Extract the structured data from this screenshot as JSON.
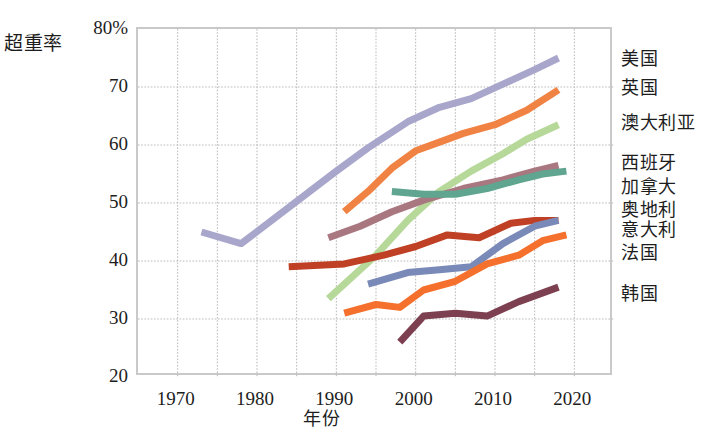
{
  "chart_data": {
    "type": "line",
    "title": "",
    "xlabel": "年份",
    "ylabel": "超重率",
    "xlim": [
      1965,
      2025
    ],
    "ylim": [
      20,
      80
    ],
    "grid": true,
    "legend_position": "right-inline",
    "x_ticks": [
      "1970",
      "1980",
      "1990",
      "2000",
      "2010",
      "2020"
    ],
    "x_tick_values": [
      1970,
      1980,
      1990,
      2000,
      2010,
      2020
    ],
    "y_ticks": [
      "20",
      "30",
      "40",
      "50",
      "60",
      "70",
      "80%"
    ],
    "y_tick_values": [
      20,
      30,
      40,
      50,
      60,
      70,
      80
    ],
    "series": [
      {
        "name": "美国",
        "color": "#a8a6cb",
        "label_y": 74.5,
        "x": [
          1973,
          1978,
          1990,
          1994,
          1999,
          2003,
          2007,
          2011,
          2015,
          2018
        ],
        "values": [
          45.0,
          43.0,
          55.5,
          59.5,
          64.0,
          66.5,
          68.0,
          70.5,
          73.0,
          75.0
        ]
      },
      {
        "name": "英国",
        "color": "#f08344",
        "label_y": 69.5,
        "x": [
          1991,
          1994,
          1997,
          2000,
          2003,
          2006,
          2010,
          2014,
          2018
        ],
        "values": [
          48.5,
          52.0,
          56.0,
          59.0,
          60.5,
          62.0,
          63.5,
          66.0,
          69.5
        ]
      },
      {
        "name": "澳大利亚",
        "color": "#b6d99a",
        "label_y": 63.5,
        "x": [
          1989,
          1995,
          1999,
          2003,
          2007,
          2011,
          2014,
          2018
        ],
        "values": [
          33.5,
          41.0,
          47.0,
          52.0,
          55.5,
          58.5,
          61.0,
          63.5
        ]
      },
      {
        "name": "西班牙",
        "color": "#a9777f",
        "label_y": 56.5,
        "x": [
          1989,
          1993,
          1997,
          2001,
          2006,
          2011,
          2015,
          2018
        ],
        "values": [
          44.0,
          46.0,
          48.5,
          50.5,
          52.5,
          54.0,
          55.5,
          56.5
        ]
      },
      {
        "name": "加拿大",
        "color": "#5fa58f",
        "label_y": 52.5,
        "x": [
          1997,
          2001,
          2005,
          2009,
          2013,
          2016,
          2019
        ],
        "values": [
          52.0,
          51.5,
          51.5,
          52.5,
          54.0,
          55.0,
          55.5
        ]
      },
      {
        "name": "奥地利",
        "color": "#bf4024",
        "label_y": 48.5,
        "x": [
          1984,
          1991,
          1996,
          2000,
          2004,
          2008,
          2012,
          2015,
          2018
        ],
        "values": [
          39.0,
          39.5,
          41.0,
          42.5,
          44.5,
          44.0,
          46.5,
          47.0,
          47.0
        ]
      },
      {
        "name": "意大利",
        "color": "#7a8ab8",
        "label_y": 45.0,
        "x": [
          1994,
          1999,
          2003,
          2007,
          2011,
          2015,
          2018
        ],
        "values": [
          36.0,
          38.0,
          38.5,
          39.0,
          43.0,
          46.0,
          47.0
        ]
      },
      {
        "name": "法国",
        "color": "#f4702c",
        "label_y": 41.0,
        "x": [
          1991,
          1995,
          1998,
          2001,
          2005,
          2009,
          2013,
          2016,
          2019
        ],
        "values": [
          31.0,
          32.5,
          32.0,
          35.0,
          36.5,
          39.5,
          41.0,
          43.5,
          44.5
        ]
      },
      {
        "name": "韩国",
        "color": "#7d4050",
        "label_y": 34.0,
        "x": [
          1998,
          2001,
          2005,
          2009,
          2013,
          2018
        ],
        "values": [
          26.0,
          30.5,
          31.0,
          30.5,
          33.0,
          35.5
        ]
      }
    ]
  }
}
